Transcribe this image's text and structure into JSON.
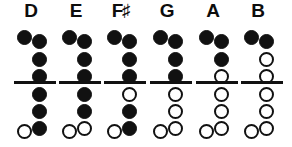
{
  "legend": {
    "closed_symbol": "filled-circle",
    "open_symbol": "open-circle",
    "closed_meaning": "hole covered",
    "open_meaning": "hole open"
  },
  "colors": {
    "ink": "#111111",
    "background": "#ffffff",
    "label": "#0d0d0d"
  },
  "layout": {
    "columns": 6,
    "main_holes_per_column": 6,
    "holes_above_divider": 3,
    "holes_below_divider": 3,
    "has_thumb_hole": true,
    "has_pinky_hole": true
  },
  "notes": [
    {
      "name": "D",
      "label": "D",
      "accidental": "",
      "thumb": "closed",
      "main": [
        "closed",
        "closed",
        "closed",
        "closed",
        "closed",
        "closed"
      ],
      "pinky": "open"
    },
    {
      "name": "E",
      "label": "E",
      "accidental": "",
      "thumb": "closed",
      "main": [
        "closed",
        "closed",
        "closed",
        "closed",
        "closed",
        "open"
      ],
      "pinky": "open"
    },
    {
      "name": "F-sharp",
      "label": "F",
      "accidental": "♯",
      "thumb": "closed",
      "main": [
        "closed",
        "closed",
        "closed",
        "open",
        "closed",
        "closed"
      ],
      "pinky": "open"
    },
    {
      "name": "G",
      "label": "G",
      "accidental": "",
      "thumb": "closed",
      "main": [
        "closed",
        "closed",
        "closed",
        "open",
        "open",
        "open"
      ],
      "pinky": "open"
    },
    {
      "name": "A",
      "label": "A",
      "accidental": "",
      "thumb": "closed",
      "main": [
        "closed",
        "closed",
        "open",
        "open",
        "open",
        "open"
      ],
      "pinky": "open"
    },
    {
      "name": "B",
      "label": "B",
      "accidental": "",
      "thumb": "closed",
      "main": [
        "closed",
        "open",
        "open",
        "open",
        "open",
        "open"
      ],
      "pinky": "open"
    }
  ]
}
